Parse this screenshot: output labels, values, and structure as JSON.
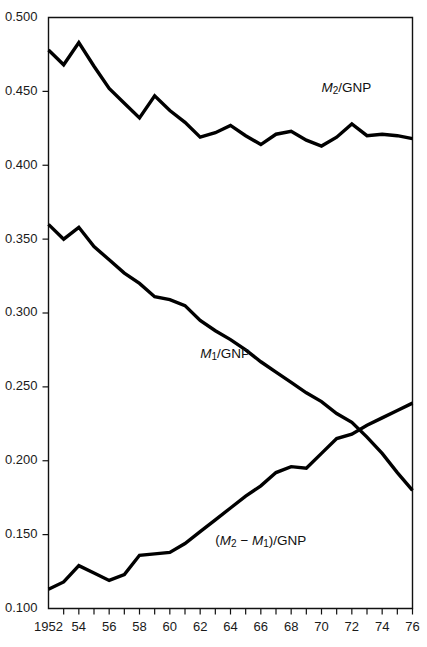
{
  "chart_data": {
    "type": "line",
    "title": "",
    "subtitle": "",
    "xlabel": "",
    "ylabel": "",
    "xlim": [
      1952,
      1976
    ],
    "ylim": [
      0.1,
      0.5
    ],
    "grid": false,
    "legend_position": "inline-annotations",
    "x": [
      1952,
      1953,
      1954,
      1955,
      1956,
      1957,
      1958,
      1959,
      1960,
      1961,
      1962,
      1963,
      1964,
      1965,
      1966,
      1967,
      1968,
      1969,
      1970,
      1971,
      1972,
      1973,
      1974,
      1975,
      1976
    ],
    "y_ticks": [
      0.1,
      0.15,
      0.2,
      0.25,
      0.3,
      0.35,
      0.4,
      0.45,
      0.5
    ],
    "y_tick_labels": [
      "0.100",
      "0.150",
      "0.200",
      "0.250",
      "0.300",
      "0.350",
      "0.400",
      "0.450",
      "0.500"
    ],
    "x_ticks": [
      1952,
      1953,
      1954,
      1955,
      1956,
      1957,
      1958,
      1959,
      1960,
      1961,
      1962,
      1963,
      1964,
      1965,
      1966,
      1967,
      1968,
      1969,
      1970,
      1971,
      1972,
      1973,
      1974,
      1975,
      1976
    ],
    "x_tick_labels": [
      "1952",
      "",
      "54",
      "",
      "56",
      "",
      "58",
      "",
      "60",
      "",
      "62",
      "",
      "64",
      "",
      "66",
      "",
      "68",
      "",
      "70",
      "",
      "72",
      "",
      "74",
      "",
      "76"
    ],
    "series": [
      {
        "name": "M2/GNP",
        "label_html": "<tspan class=\"mvar\">M</tspan><tspan dy=\"3\" font-size=\"10\">2</tspan><tspan dy=\"-3\">/GNP</tspan>",
        "color": "#000000",
        "values": [
          0.478,
          0.468,
          0.483,
          0.467,
          0.452,
          0.442,
          0.432,
          0.447,
          0.437,
          0.429,
          0.419,
          0.422,
          0.427,
          0.42,
          0.414,
          0.421,
          0.423,
          0.417,
          0.413,
          0.419,
          0.428,
          0.42,
          0.421,
          0.42,
          0.418
        ]
      },
      {
        "name": "M1/GNP",
        "label_html": "<tspan class=\"mvar\">M</tspan><tspan dy=\"3\" font-size=\"10\">1</tspan><tspan dy=\"-3\">/GNP</tspan>",
        "color": "#000000",
        "values": [
          0.36,
          0.35,
          0.358,
          0.345,
          0.336,
          0.327,
          0.32,
          0.311,
          0.309,
          0.305,
          0.295,
          0.288,
          0.282,
          0.275,
          0.267,
          0.26,
          0.253,
          0.246,
          0.24,
          0.232,
          0.226,
          0.216,
          0.205,
          0.192,
          0.18
        ]
      },
      {
        "name": "(M2-M1)/GNP",
        "label_html": "(<tspan class=\"mvar\">M</tspan><tspan dy=\"3\" font-size=\"10\">2</tspan><tspan dy=\"-3\"> − </tspan><tspan class=\"mvar\">M</tspan><tspan dy=\"3\" font-size=\"10\">1</tspan><tspan dy=\"-3\">)/GNP</tspan>",
        "color": "#000000",
        "values": [
          0.113,
          0.118,
          0.129,
          0.124,
          0.119,
          0.123,
          0.136,
          0.137,
          0.138,
          0.144,
          0.152,
          0.16,
          0.168,
          0.176,
          0.183,
          0.192,
          0.196,
          0.195,
          0.205,
          0.215,
          0.218,
          0.224,
          0.229,
          0.234,
          0.239
        ]
      }
    ],
    "annotations": [
      {
        "text": "M2/GNP",
        "x": 1970,
        "y": 0.452
      },
      {
        "text": "M1/GNP",
        "x": 1962,
        "y": 0.272
      },
      {
        "text": "(M2-M1)/GNP",
        "x": 1963,
        "y": 0.146
      }
    ]
  },
  "axis": {
    "y_axis_name": "value-axis",
    "x_axis_name": "year-axis"
  }
}
